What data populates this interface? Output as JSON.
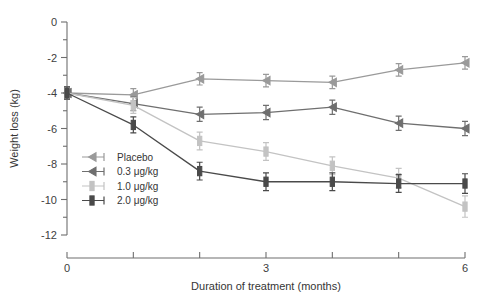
{
  "chart_data": {
    "type": "line",
    "title": "",
    "xlabel": "Duration of treatment (months)",
    "ylabel": "Weight loss (kg)",
    "x": [
      0,
      1,
      2,
      3,
      4,
      5,
      6
    ],
    "xlim": [
      0,
      6
    ],
    "ylim": [
      -12,
      0
    ],
    "xticks": [
      0,
      1,
      2,
      3,
      4,
      5,
      6
    ],
    "xtick_labels": [
      "0",
      "",
      "",
      "3",
      "",
      "",
      "6"
    ],
    "yticks": [
      0,
      -1,
      -2,
      -3,
      -4,
      -5,
      -6,
      -7,
      -8,
      -9,
      -10,
      -11,
      -12
    ],
    "ytick_labels": [
      "0",
      "",
      "-2",
      "",
      "-4",
      "",
      "-6",
      "",
      "-8",
      "",
      "-10",
      "",
      "-12"
    ],
    "grid": false,
    "legend_position": "lower-left-inside",
    "errorbars": true,
    "series": [
      {
        "name": "Placebo",
        "color": "#9a9a9a",
        "marker": "triangle-left",
        "values": [
          -4.0,
          -4.1,
          -3.2,
          -3.3,
          -3.4,
          -2.7,
          -2.3
        ],
        "errors": [
          0.35,
          0.35,
          0.35,
          0.35,
          0.35,
          0.35,
          0.35
        ]
      },
      {
        "name": "0.3 μg/kg",
        "color": "#6f6f6f",
        "marker": "triangle-left",
        "values": [
          -4.0,
          -4.6,
          -5.2,
          -5.1,
          -4.8,
          -5.7,
          -6.0
        ],
        "errors": [
          0.35,
          0.4,
          0.4,
          0.4,
          0.4,
          0.4,
          0.4
        ]
      },
      {
        "name": "1.0 μg/kg",
        "color": "#c3c3c3",
        "marker": "bar",
        "values": [
          -4.0,
          -4.7,
          -6.7,
          -7.3,
          -8.1,
          -8.8,
          -10.4
        ],
        "errors": [
          0.35,
          0.45,
          0.5,
          0.5,
          0.5,
          0.55,
          0.6
        ]
      },
      {
        "name": "2.0 μg/kg",
        "color": "#4a4a4a",
        "marker": "bar",
        "values": [
          -4.0,
          -5.8,
          -8.4,
          -9.0,
          -9.0,
          -9.1,
          -9.1
        ],
        "errors": [
          0.35,
          0.45,
          0.5,
          0.5,
          0.5,
          0.5,
          0.55
        ]
      }
    ]
  },
  "legend": {
    "items": [
      {
        "label": "Placebo",
        "color": "#9a9a9a"
      },
      {
        "label": "0.3 μg/kg",
        "color": "#6f6f6f"
      },
      {
        "label": "1.0 μg/kg",
        "color": "#c3c3c3"
      },
      {
        "label": "2.0 μg/kg",
        "color": "#4a4a4a"
      }
    ]
  }
}
